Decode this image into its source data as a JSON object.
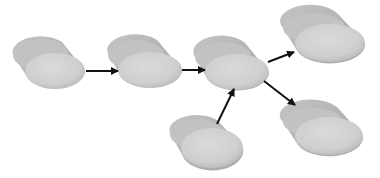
{
  "diagram": {
    "type": "flow",
    "background": "#ffffff",
    "node_color_front": "#d0d0d0",
    "node_color_back": "#bdbdbd",
    "arrow_color": "#111111",
    "nodes": [
      {
        "id": "A",
        "label": "",
        "cx": 55,
        "cy": 71
      },
      {
        "id": "B",
        "label": "",
        "cx": 150,
        "cy": 70
      },
      {
        "id": "C",
        "label": "",
        "cx": 237,
        "cy": 72
      },
      {
        "id": "D",
        "label": "",
        "cx": 330,
        "cy": 43
      },
      {
        "id": "E",
        "label": "",
        "cx": 212,
        "cy": 148
      },
      {
        "id": "F",
        "label": "",
        "cx": 329,
        "cy": 136
      }
    ],
    "edges": [
      {
        "from": "A",
        "to": "B"
      },
      {
        "from": "B",
        "to": "C"
      },
      {
        "from": "C",
        "to": "D"
      },
      {
        "from": "C",
        "to": "F"
      },
      {
        "from": "E",
        "to": "C"
      }
    ]
  }
}
